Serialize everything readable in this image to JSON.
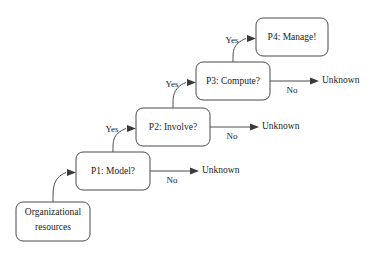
{
  "diagram": {
    "background_color": "#ffffff",
    "stroke_color": "#4a4a4a",
    "text_color": "#1a1a1a",
    "nodes": [
      {
        "id": "org-resources",
        "label_line1": "Organizational",
        "label_line2": "resources",
        "shape": "rounded-rect",
        "x": 16,
        "y": 202,
        "w": 74,
        "h": 39
      },
      {
        "id": "p1",
        "label": "P1: Model?",
        "shape": "rounded-rect",
        "x": 76,
        "y": 152,
        "w": 74,
        "h": 38
      },
      {
        "id": "p2",
        "label": "P2: Involve?",
        "shape": "rounded-rect",
        "x": 136,
        "y": 108,
        "w": 74,
        "h": 38
      },
      {
        "id": "p3",
        "label": "P3: Compute?",
        "shape": "rounded-rect",
        "x": 196,
        "y": 62,
        "w": 74,
        "h": 38
      },
      {
        "id": "p4",
        "label": "P4: Manage!",
        "shape": "rounded-rect",
        "x": 256,
        "y": 18,
        "w": 72,
        "h": 38
      }
    ],
    "terminals": [
      {
        "id": "unknown-1",
        "label": "Unknown",
        "x": 202,
        "y": 171
      },
      {
        "id": "unknown-2",
        "label": "Unknown",
        "x": 262,
        "y": 127
      },
      {
        "id": "unknown-3",
        "label": "Unknown",
        "x": 322,
        "y": 81
      }
    ],
    "edges": [
      {
        "id": "org-to-p1",
        "label": "",
        "from": "org-resources",
        "to": "p1"
      },
      {
        "id": "p1-yes-p2",
        "label": "Yes",
        "label_x": 112,
        "label_y": 130,
        "from": "p1",
        "to": "p2"
      },
      {
        "id": "p2-yes-p3",
        "label": "Yes",
        "label_x": 172,
        "label_y": 85,
        "from": "p2",
        "to": "p3"
      },
      {
        "id": "p3-yes-p4",
        "label": "Yes",
        "label_x": 232,
        "label_y": 41,
        "from": "p3",
        "to": "p4"
      },
      {
        "id": "p1-no-unknown",
        "label": "No",
        "label_x": 172,
        "label_y": 181,
        "from": "p1",
        "to": "unknown-1"
      },
      {
        "id": "p2-no-unknown",
        "label": "No",
        "label_x": 232,
        "label_y": 137,
        "from": "p2",
        "to": "unknown-2"
      },
      {
        "id": "p3-no-unknown",
        "label": "No",
        "label_x": 292,
        "label_y": 91,
        "from": "p3",
        "to": "unknown-3"
      }
    ]
  }
}
